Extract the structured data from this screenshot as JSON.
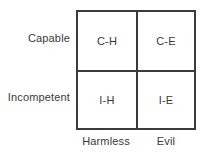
{
  "diagram": {
    "type": "2x2-matrix",
    "row_axis": {
      "labels": [
        {
          "key": "capable",
          "text": "Capable"
        },
        {
          "key": "incompetent",
          "text": "Incompetent"
        }
      ]
    },
    "column_axis": {
      "labels": [
        {
          "key": "harmless",
          "text": "Harmless"
        },
        {
          "key": "evil",
          "text": "Evil"
        }
      ]
    },
    "cells": [
      {
        "key": "c-h",
        "text": "C-H",
        "row": "Capable",
        "column": "Harmless"
      },
      {
        "key": "c-e",
        "text": "C-E",
        "row": "Capable",
        "column": "Evil"
      },
      {
        "key": "i-h",
        "text": "I-H",
        "row": "Incompetent",
        "column": "Harmless"
      },
      {
        "key": "i-e",
        "text": "I-E",
        "row": "Incompetent",
        "column": "Evil"
      }
    ],
    "colors": {
      "stroke": "#3b3b3b",
      "text": "#3a3a3a",
      "background": "#ffffff"
    }
  }
}
